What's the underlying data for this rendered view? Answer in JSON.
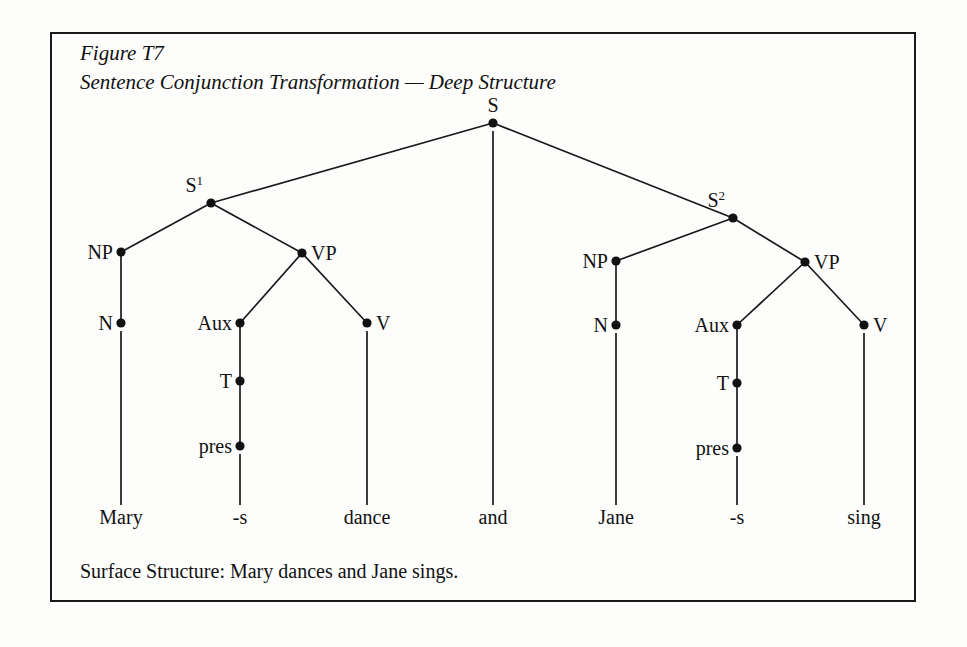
{
  "figure": {
    "title_line1": "Figure T7",
    "title_line2": "Sentence Conjunction Transformation — Deep Structure",
    "caption": "Surface Structure:  Mary dances and Jane sings.",
    "border_color": "#1a1a1a",
    "ink_color": "#111111",
    "background_color": "#fdfdfc"
  },
  "tree": {
    "type": "syntax-tree",
    "nodes": [
      {
        "id": "S",
        "label": "S",
        "sup": "",
        "x": 493,
        "y": 123,
        "label_pos": "above"
      },
      {
        "id": "S1",
        "label": "S",
        "sup": "1",
        "x": 211,
        "y": 203,
        "label_pos": "above-left"
      },
      {
        "id": "S2",
        "label": "S",
        "sup": "2",
        "x": 733,
        "y": 218,
        "label_pos": "above-left"
      },
      {
        "id": "NP1",
        "label": "NP",
        "sup": "",
        "x": 121,
        "y": 252,
        "label_pos": "left"
      },
      {
        "id": "VP1",
        "label": "VP",
        "sup": "",
        "x": 302,
        "y": 253,
        "label_pos": "right"
      },
      {
        "id": "N1",
        "label": "N",
        "sup": "",
        "x": 121,
        "y": 323,
        "label_pos": "left"
      },
      {
        "id": "Aux1",
        "label": "Aux",
        "sup": "",
        "x": 240,
        "y": 323,
        "label_pos": "left"
      },
      {
        "id": "V1",
        "label": "V",
        "sup": "",
        "x": 367,
        "y": 323,
        "label_pos": "right"
      },
      {
        "id": "T1",
        "label": "T",
        "sup": "",
        "x": 240,
        "y": 381,
        "label_pos": "left"
      },
      {
        "id": "pres1",
        "label": "pres",
        "sup": "",
        "x": 240,
        "y": 446,
        "label_pos": "left"
      },
      {
        "id": "NP2",
        "label": "NP",
        "sup": "",
        "x": 616,
        "y": 261,
        "label_pos": "left"
      },
      {
        "id": "VP2",
        "label": "VP",
        "sup": "",
        "x": 805,
        "y": 262,
        "label_pos": "right"
      },
      {
        "id": "N2",
        "label": "N",
        "sup": "",
        "x": 616,
        "y": 325,
        "label_pos": "left"
      },
      {
        "id": "Aux2",
        "label": "Aux",
        "sup": "",
        "x": 737,
        "y": 325,
        "label_pos": "left"
      },
      {
        "id": "V2",
        "label": "V",
        "sup": "",
        "x": 864,
        "y": 325,
        "label_pos": "right"
      },
      {
        "id": "T2",
        "label": "T",
        "sup": "",
        "x": 737,
        "y": 383,
        "label_pos": "left"
      },
      {
        "id": "pres2",
        "label": "pres",
        "sup": "",
        "x": 737,
        "y": 448,
        "label_pos": "left"
      }
    ],
    "edges": [
      {
        "from": "S",
        "to": "S1"
      },
      {
        "from": "S",
        "to": "S2"
      },
      {
        "from": "S1",
        "to": "NP1"
      },
      {
        "from": "S1",
        "to": "VP1"
      },
      {
        "from": "NP1",
        "to": "N1"
      },
      {
        "from": "VP1",
        "to": "Aux1"
      },
      {
        "from": "VP1",
        "to": "V1"
      },
      {
        "from": "Aux1",
        "to": "T1"
      },
      {
        "from": "T1",
        "to": "pres1"
      },
      {
        "from": "S2",
        "to": "NP2"
      },
      {
        "from": "S2",
        "to": "VP2"
      },
      {
        "from": "NP2",
        "to": "N2"
      },
      {
        "from": "VP2",
        "to": "Aux2"
      },
      {
        "from": "VP2",
        "to": "V2"
      },
      {
        "from": "Aux2",
        "to": "T2"
      },
      {
        "from": "T2",
        "to": "pres2"
      }
    ],
    "terminals": [
      {
        "id": "t-mary",
        "label": "Mary",
        "x": 121,
        "from": "N1",
        "line_top": 331,
        "line_bottom": 505,
        "text_y": 524
      },
      {
        "id": "t-s1",
        "label": "-s",
        "x": 240,
        "from": "pres1",
        "line_top": 454,
        "line_bottom": 505,
        "text_y": 524
      },
      {
        "id": "t-dance",
        "label": "dance",
        "x": 367,
        "from": "V1",
        "line_top": 331,
        "line_bottom": 505,
        "text_y": 524
      },
      {
        "id": "t-and",
        "label": "and",
        "x": 493,
        "from": "S",
        "line_top": 131,
        "line_bottom": 505,
        "text_y": 524
      },
      {
        "id": "t-jane",
        "label": "Jane",
        "x": 616,
        "from": "N2",
        "line_top": 333,
        "line_bottom": 505,
        "text_y": 524
      },
      {
        "id": "t-s2",
        "label": "-s",
        "x": 737,
        "from": "pres2",
        "line_top": 456,
        "line_bottom": 505,
        "text_y": 524
      },
      {
        "id": "t-sing",
        "label": "sing",
        "x": 864,
        "from": "V2",
        "line_top": 333,
        "line_bottom": 505,
        "text_y": 524
      }
    ],
    "title_x": 80,
    "title_y1": 60,
    "title_y2": 89,
    "caption_x": 80,
    "caption_y": 578
  }
}
